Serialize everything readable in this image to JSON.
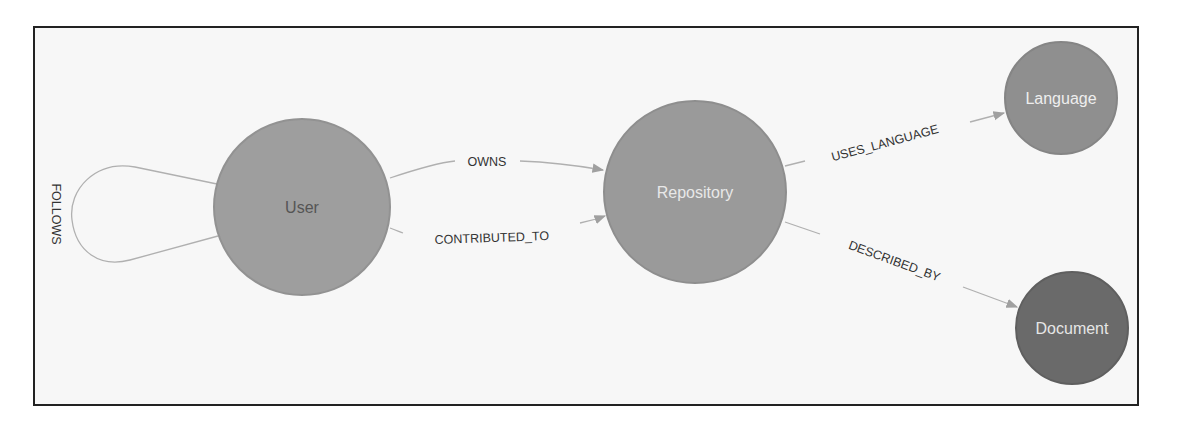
{
  "diagram": {
    "type": "graph-schema",
    "nodes": [
      {
        "id": "user",
        "label": "User",
        "color": "#9e9e9e",
        "text_color": "#555555"
      },
      {
        "id": "repository",
        "label": "Repository",
        "color": "#9a9a9a",
        "text_color": "#e8e8e8"
      },
      {
        "id": "language",
        "label": "Language",
        "color": "#8f8f8f",
        "text_color": "#eeeeee"
      },
      {
        "id": "document",
        "label": "Document",
        "color": "#6a6a6a",
        "text_color": "#e6e6e6"
      }
    ],
    "edges": [
      {
        "id": "follows",
        "from": "user",
        "to": "user",
        "label": "FOLLOWS"
      },
      {
        "id": "owns",
        "from": "user",
        "to": "repository",
        "label": "OWNS"
      },
      {
        "id": "contributed_to",
        "from": "user",
        "to": "repository",
        "label": "CONTRIBUTED_TO"
      },
      {
        "id": "uses_language",
        "from": "repository",
        "to": "language",
        "label": "USES_LANGUAGE"
      },
      {
        "id": "described_by",
        "from": "repository",
        "to": "document",
        "label": "DESCRIBED_BY"
      }
    ],
    "edge_color": "#a8a8a8"
  }
}
